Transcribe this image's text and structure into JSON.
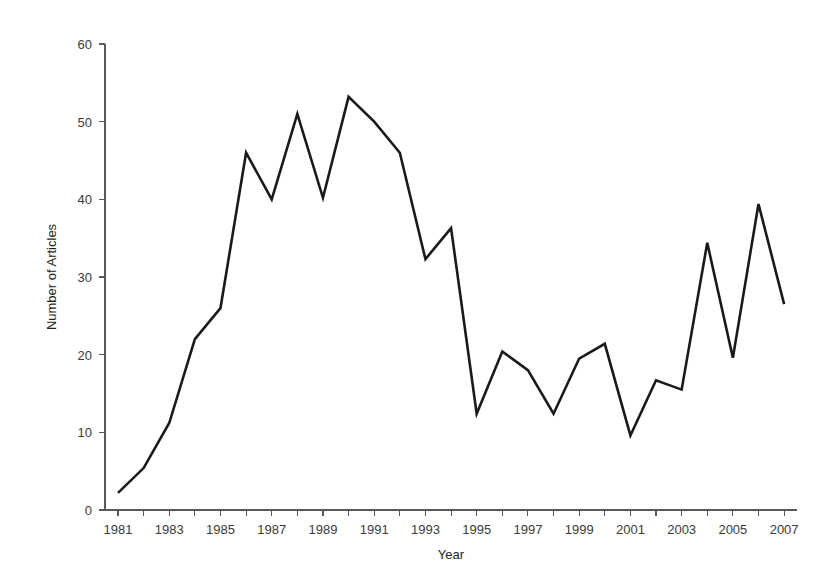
{
  "chart_data": {
    "type": "line",
    "title": "",
    "xlabel": "Year",
    "ylabel": "Number of Articles",
    "xlim": [
      1980.5,
      2007.5
    ],
    "ylim": [
      0,
      60
    ],
    "grid": false,
    "legend": null,
    "x_tick_step_labeled": 2,
    "x_tick_step_minor": 1,
    "y_tick_step": 10,
    "x_tick_labels": [
      "1981",
      "1983",
      "1985",
      "1987",
      "1989",
      "1991",
      "1993",
      "1995",
      "1997",
      "1999",
      "2001",
      "2003",
      "2005",
      "2007"
    ],
    "y_tick_labels": [
      "0",
      "10",
      "20",
      "30",
      "40",
      "50",
      "60"
    ],
    "categories": [
      1981,
      1982,
      1983,
      1984,
      1985,
      1986,
      1987,
      1988,
      1989,
      1990,
      1991,
      1992,
      1993,
      1994,
      1995,
      1996,
      1997,
      1998,
      1999,
      2000,
      2001,
      2002,
      2003,
      2004,
      2005,
      2006,
      2007
    ],
    "values": [
      2.2,
      5.4,
      11.2,
      22.0,
      26.0,
      46.0,
      40.0,
      51.0,
      40.2,
      53.2,
      50.0,
      46.0,
      32.3,
      36.3,
      12.4,
      20.4,
      18.0,
      12.4,
      19.5,
      21.4,
      9.6,
      16.7,
      15.5,
      34.4,
      19.6,
      39.4,
      26.5
    ],
    "series_name": "Number of Articles",
    "line_color": "#1a1a1a",
    "axis_color": "#58595b",
    "background_color": "#ffffff"
  },
  "geometry": {
    "plot_left": 105,
    "plot_right": 797,
    "plot_bottom": 510,
    "plot_top": 44,
    "x_first": 118,
    "x_step": 25.62
  }
}
